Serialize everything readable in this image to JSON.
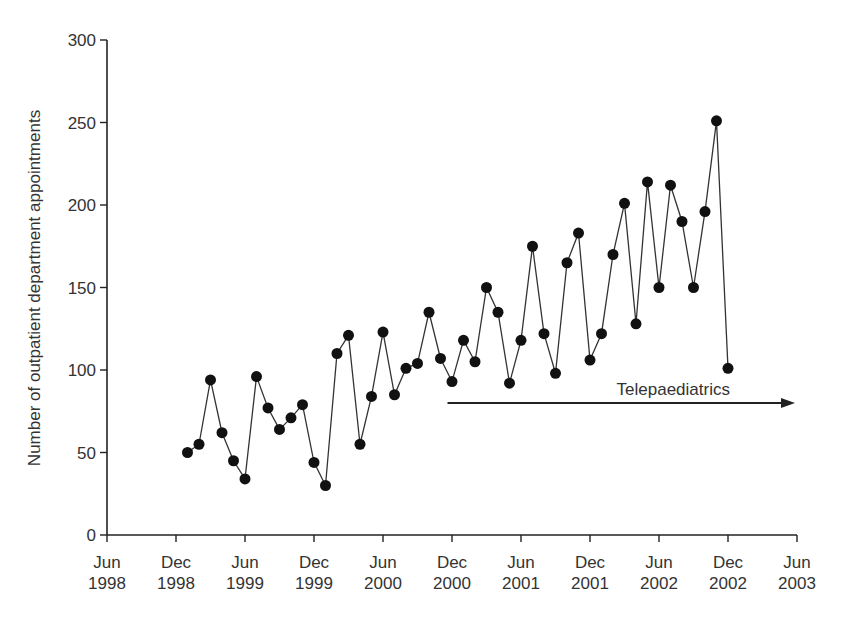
{
  "chart_data": {
    "type": "line",
    "title": "",
    "xlabel": "",
    "ylabel": "Number of outpatient department appointments",
    "ylim": [
      0,
      300
    ],
    "yticks": [
      0,
      50,
      100,
      150,
      200,
      250,
      300
    ],
    "xticks": [
      {
        "month": "Jun",
        "year": "1998"
      },
      {
        "month": "Dec",
        "year": "1998"
      },
      {
        "month": "Jun",
        "year": "1999"
      },
      {
        "month": "Dec",
        "year": "1999"
      },
      {
        "month": "Jun",
        "year": "2000"
      },
      {
        "month": "Dec",
        "year": "2000"
      },
      {
        "month": "Jun",
        "year": "2001"
      },
      {
        "month": "Dec",
        "year": "2001"
      },
      {
        "month": "Jun",
        "year": "2002"
      },
      {
        "month": "Dec",
        "year": "2002"
      },
      {
        "month": "Jun",
        "year": "2003"
      }
    ],
    "grid": false,
    "legend": null,
    "x_start": "Jan 1999",
    "x_interval": "monthly",
    "series": [
      {
        "name": "Outpatient department appointments",
        "values": [
          50,
          55,
          94,
          62,
          45,
          34,
          96,
          77,
          64,
          71,
          79,
          44,
          30,
          110,
          121,
          55,
          84,
          123,
          85,
          101,
          104,
          135,
          107,
          93,
          118,
          105,
          150,
          135,
          92,
          118,
          175,
          122,
          98,
          165,
          183,
          106,
          122,
          170,
          201,
          128,
          214,
          150,
          212,
          190,
          150,
          196,
          251,
          101
        ]
      }
    ],
    "annotations": [
      {
        "text": "Telepaediatrics",
        "type": "arrow",
        "from": "Nov 2000",
        "to": "Jun 2003",
        "y": 80
      }
    ]
  }
}
